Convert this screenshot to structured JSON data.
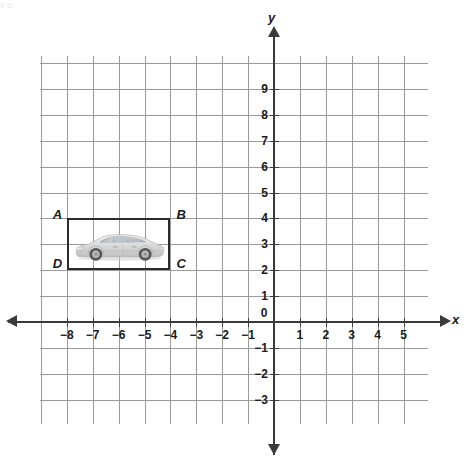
{
  "figure": {
    "type": "coordinate-plane",
    "title": "",
    "axes": {
      "x_label": "x",
      "y_label": "y",
      "origin_label": "0",
      "x_ticks": [
        "-8",
        "-7",
        "-6",
        "-5",
        "-4",
        "-3",
        "-2",
        "-1",
        "1",
        "2",
        "3",
        "4",
        "5"
      ],
      "y_ticks": [
        "9",
        "8",
        "7",
        "6",
        "5",
        "4",
        "3",
        "2",
        "1",
        "-1",
        "-2",
        "-3"
      ],
      "x_min": -9,
      "x_max": 6,
      "y_min": -4,
      "y_max": 10,
      "grid": true,
      "grid_color": "#9a9a9a",
      "axis_color": "#3a3a3a"
    },
    "shape": {
      "name": "rectangle-ABCD",
      "stroke_color": "#2b2b2b",
      "vertices": [
        {
          "label": "A",
          "x": -8,
          "y": 4,
          "corner": "top-left"
        },
        {
          "label": "B",
          "x": -4,
          "y": 4,
          "corner": "top-right"
        },
        {
          "label": "C",
          "x": -4,
          "y": 2,
          "corner": "bottom-right"
        },
        {
          "label": "D",
          "x": -8,
          "y": 2,
          "corner": "bottom-left"
        }
      ]
    },
    "image_inside": {
      "name": "car-image",
      "subject": "silver sedan car facing left",
      "body_color": "#d6d6d6",
      "window_color": "#b8bcc0",
      "wheel_color": "#6e6e6e"
    },
    "header_ghost": "y                                                                                                          p"
  }
}
